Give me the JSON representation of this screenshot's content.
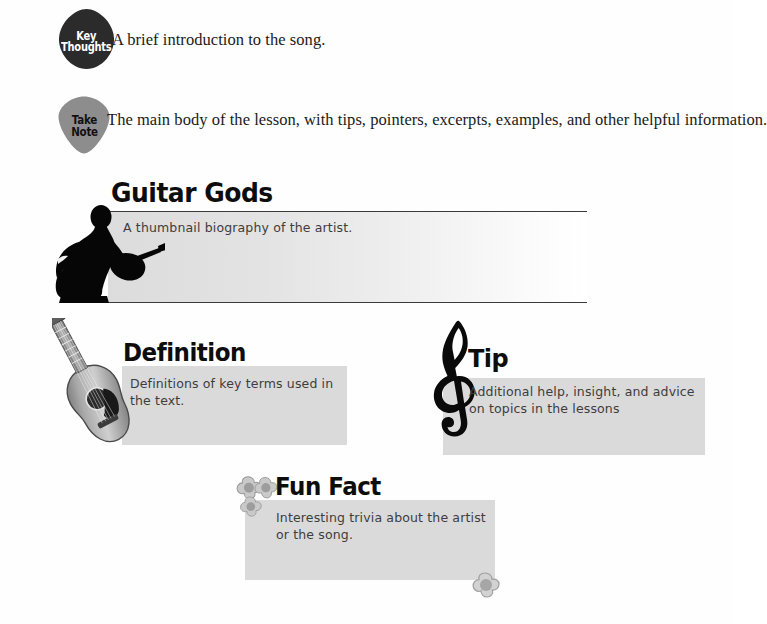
{
  "page": {
    "background": "#ffffff",
    "accent_gray": "#dadada",
    "rule_color": "#3a3a3a"
  },
  "key_thoughts": {
    "icon": "guitar-pick-icon",
    "icon_color": "#2b2b2b",
    "label_line1": "Key",
    "label_line2": "Thoughts",
    "description": "A brief introduction to the song."
  },
  "take_note": {
    "icon": "guitar-pick-icon",
    "icon_color": "#8d8d8d",
    "label_line1": "Take",
    "label_line2": "Note",
    "description": "The main body of the lesson, with tips, pointers, excerpts, examples, and other helpful information."
  },
  "guitar_gods": {
    "icon": "seated-guitarist-silhouette-icon",
    "title": "Guitar Gods",
    "body": "A thumbnail biography of the artist."
  },
  "definition": {
    "icon": "acoustic-guitar-photo-icon",
    "title": "Definition",
    "body": "Definitions of key terms used in the text."
  },
  "tip": {
    "icon": "treble-clef-icon",
    "title": "Tip",
    "body": "Additional help, insight, and advice on topics in the lessons"
  },
  "fun_fact": {
    "icon": "flower-cluster-icon",
    "corner_icon": "flower-icon",
    "title": "Fun Fact",
    "body": "Interesting trivia about the artist or the song."
  }
}
